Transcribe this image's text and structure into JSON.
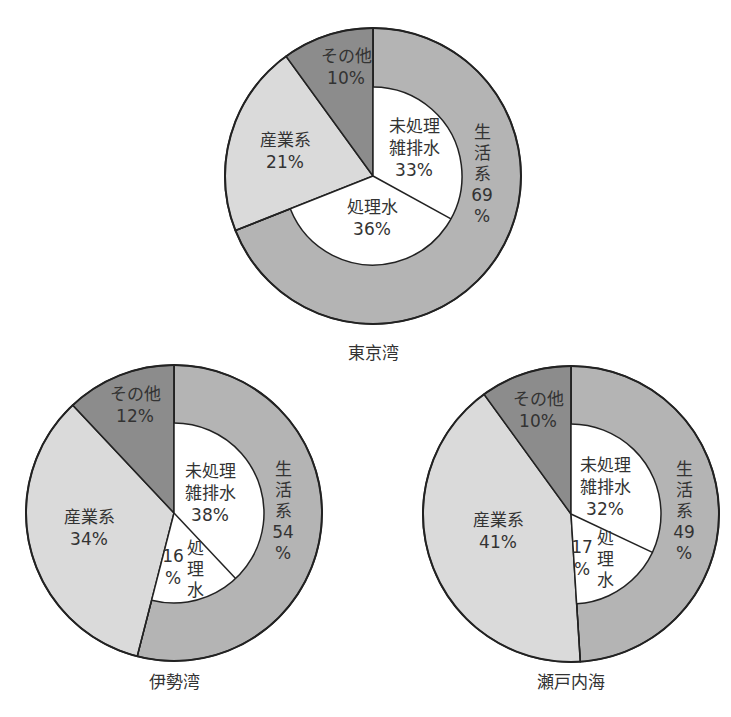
{
  "colors": {
    "domestic": "#b4b4b4",
    "other": "#8c8c8c",
    "industrial": "#dadada",
    "inner": "#ffffff",
    "stroke": "#222222"
  },
  "chart_data": [
    {
      "type": "pie",
      "title": "東京湾",
      "cx": 373,
      "cy": 176,
      "r": 148,
      "ir": 89,
      "title_pos": [
        373,
        359
      ],
      "outer": [
        {
          "name": "生活系",
          "value": 69,
          "color_key": "domestic"
        },
        {
          "name": "産業系",
          "value": 21,
          "color_key": "industrial"
        },
        {
          "name": "その他",
          "value": 10,
          "color_key": "other"
        }
      ],
      "inner": [
        {
          "name": "未処理雑排水",
          "value": 33
        },
        {
          "name": "処理水",
          "value": 36
        }
      ],
      "labels": [
        {
          "lines": [
            "その他",
            "10%"
          ],
          "x": 346,
          "y": 62,
          "dir": "h"
        },
        {
          "lines": [
            "産業系",
            "21%"
          ],
          "x": 285,
          "y": 146,
          "dir": "h"
        },
        {
          "lines": [
            "未処理",
            "雑排水",
            "33%"
          ],
          "x": 414,
          "y": 132,
          "dir": "h"
        },
        {
          "lines": [
            "処理水",
            "36%"
          ],
          "x": 372,
          "y": 213,
          "dir": "h"
        },
        {
          "lines": [
            "生",
            "活",
            "系",
            "69",
            "%"
          ],
          "x": 482,
          "y": 138,
          "dir": "v"
        }
      ]
    },
    {
      "type": "pie",
      "title": "伊勢湾",
      "cx": 174,
      "cy": 513,
      "r": 148,
      "ir": 90,
      "title_pos": [
        174,
        688
      ],
      "outer": [
        {
          "name": "生活系",
          "value": 54,
          "color_key": "domestic"
        },
        {
          "name": "産業系",
          "value": 34,
          "color_key": "industrial"
        },
        {
          "name": "その他",
          "value": 12,
          "color_key": "other"
        }
      ],
      "inner": [
        {
          "name": "未処理雑排水",
          "value": 38
        },
        {
          "name": "処理水",
          "value": 16
        }
      ],
      "labels": [
        {
          "lines": [
            "その他",
            "12%"
          ],
          "x": 135,
          "y": 400,
          "dir": "h"
        },
        {
          "lines": [
            "産業系",
            "34%"
          ],
          "x": 89,
          "y": 523,
          "dir": "h"
        },
        {
          "lines": [
            "未処理",
            "雑排水",
            "38%"
          ],
          "x": 210,
          "y": 477,
          "dir": "h"
        },
        {
          "lines": [
            "16",
            "%"
          ],
          "x": 173,
          "y": 562,
          "dir": "h"
        },
        {
          "lines": [
            "処",
            "理",
            "水"
          ],
          "x": 195,
          "y": 554,
          "dir": "v"
        },
        {
          "lines": [
            "生",
            "活",
            "系",
            "54",
            "%"
          ],
          "x": 283,
          "y": 475,
          "dir": "v"
        }
      ]
    },
    {
      "type": "pie",
      "title": "瀬戸内海",
      "cx": 571,
      "cy": 514,
      "r": 148,
      "ir": 90,
      "title_pos": [
        571,
        688
      ],
      "outer": [
        {
          "name": "生活系",
          "value": 49,
          "color_key": "domestic"
        },
        {
          "name": "産業系",
          "value": 41,
          "color_key": "industrial"
        },
        {
          "name": "その他",
          "value": 10,
          "color_key": "other"
        }
      ],
      "inner": [
        {
          "name": "未処理雑排水",
          "value": 32
        },
        {
          "name": "処理水",
          "value": 17
        }
      ],
      "labels": [
        {
          "lines": [
            "その他",
            "10%"
          ],
          "x": 538,
          "y": 405,
          "dir": "h"
        },
        {
          "lines": [
            "産業系",
            "41%"
          ],
          "x": 498,
          "y": 526,
          "dir": "h"
        },
        {
          "lines": [
            "未処理",
            "雑排水",
            "32%"
          ],
          "x": 605,
          "y": 471,
          "dir": "h"
        },
        {
          "lines": [
            "17",
            "%"
          ],
          "x": 582,
          "y": 553,
          "dir": "h"
        },
        {
          "lines": [
            "処",
            "理",
            "水"
          ],
          "x": 605,
          "y": 544,
          "dir": "v"
        },
        {
          "lines": [
            "生",
            "活",
            "系",
            "49",
            "%"
          ],
          "x": 684,
          "y": 475,
          "dir": "v"
        }
      ]
    }
  ]
}
